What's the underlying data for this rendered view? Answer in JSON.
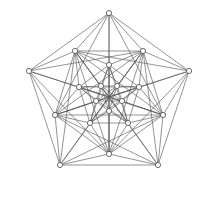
{
  "figure": {
    "width": 216,
    "height": 203,
    "background_color": "#ffffff",
    "edge_color": "#5a5a5a",
    "vertex_stroke_color": "#4a4a4a",
    "vertex_fill_color": "#ffffff",
    "edge_width": 0.65,
    "vertex_radius": 2.6,
    "vertex_count": 20,
    "edge_count": 100,
    "symmetry": "5-fold rotational"
  },
  "chart_data": {
    "type": "scatter",
    "xlabel": "",
    "ylabel": "",
    "xlim": [
      0,
      216
    ],
    "ylim": [
      0,
      203
    ],
    "grid": false,
    "legend": null,
    "rings": [
      {
        "name": "outer-pentagon",
        "radius": 84,
        "rotation_deg": -90
      },
      {
        "name": "second-pentagon",
        "radius": 57,
        "rotation_deg": 90
      },
      {
        "name": "third-pentagon",
        "radius": 32,
        "rotation_deg": -90
      },
      {
        "name": "inner-pentagon",
        "radius": 14,
        "rotation_deg": 90
      }
    ],
    "center": [
      109,
      97
    ],
    "vertices": [
      {
        "id": "A0",
        "ring": "outer-pentagon",
        "x": 109,
        "y": 13
      },
      {
        "id": "A1",
        "ring": "outer-pentagon",
        "x": 189,
        "y": 71
      },
      {
        "id": "A2",
        "ring": "outer-pentagon",
        "x": 158,
        "y": 165
      },
      {
        "id": "A3",
        "ring": "outer-pentagon",
        "x": 60,
        "y": 165
      },
      {
        "id": "A4",
        "ring": "outer-pentagon",
        "x": 29,
        "y": 71
      },
      {
        "id": "B0",
        "ring": "second-pentagon",
        "x": 109,
        "y": 154
      },
      {
        "id": "B1",
        "ring": "second-pentagon",
        "x": 55,
        "y": 115
      },
      {
        "id": "B2",
        "ring": "second-pentagon",
        "x": 75,
        "y": 51
      },
      {
        "id": "B3",
        "ring": "second-pentagon",
        "x": 143,
        "y": 51
      },
      {
        "id": "B4",
        "ring": "second-pentagon",
        "x": 163,
        "y": 115
      },
      {
        "id": "C0",
        "ring": "third-pentagon",
        "x": 109,
        "y": 65
      },
      {
        "id": "C1",
        "ring": "third-pentagon",
        "x": 139,
        "y": 87
      },
      {
        "id": "C2",
        "ring": "third-pentagon",
        "x": 128,
        "y": 123
      },
      {
        "id": "C3",
        "ring": "third-pentagon",
        "x": 90,
        "y": 123
      },
      {
        "id": "C4",
        "ring": "third-pentagon",
        "x": 79,
        "y": 87
      },
      {
        "id": "D0",
        "ring": "inner-pentagon",
        "x": 109,
        "y": 111
      },
      {
        "id": "D1",
        "ring": "inner-pentagon",
        "x": 96,
        "y": 101
      },
      {
        "id": "D2",
        "ring": "inner-pentagon",
        "x": 101,
        "y": 86
      },
      {
        "id": "D3",
        "ring": "inner-pentagon",
        "x": 117,
        "y": 86
      },
      {
        "id": "D4",
        "ring": "inner-pentagon",
        "x": 122,
        "y": 101
      }
    ],
    "edges": [
      [
        "A0",
        "A1"
      ],
      [
        "A1",
        "A2"
      ],
      [
        "A2",
        "A3"
      ],
      [
        "A3",
        "A4"
      ],
      [
        "A4",
        "A0"
      ],
      [
        "A0",
        "B0"
      ],
      [
        "A1",
        "B1"
      ],
      [
        "A2",
        "B2"
      ],
      [
        "A3",
        "B3"
      ],
      [
        "A4",
        "B4"
      ],
      [
        "A0",
        "B1"
      ],
      [
        "A1",
        "B2"
      ],
      [
        "A2",
        "B3"
      ],
      [
        "A3",
        "B4"
      ],
      [
        "A4",
        "B0"
      ],
      [
        "A0",
        "B4"
      ],
      [
        "A1",
        "B0"
      ],
      [
        "A2",
        "B1"
      ],
      [
        "A3",
        "B2"
      ],
      [
        "A4",
        "B3"
      ],
      [
        "A0",
        "B2"
      ],
      [
        "A1",
        "B3"
      ],
      [
        "A2",
        "B4"
      ],
      [
        "A3",
        "B0"
      ],
      [
        "A4",
        "B1"
      ],
      [
        "A0",
        "B3"
      ],
      [
        "A1",
        "B4"
      ],
      [
        "A2",
        "B0"
      ],
      [
        "A3",
        "B1"
      ],
      [
        "A4",
        "B2"
      ],
      [
        "B0",
        "B1"
      ],
      [
        "B1",
        "B2"
      ],
      [
        "B2",
        "B3"
      ],
      [
        "B3",
        "B4"
      ],
      [
        "B4",
        "B0"
      ],
      [
        "B0",
        "B2"
      ],
      [
        "B1",
        "B3"
      ],
      [
        "B2",
        "B4"
      ],
      [
        "B3",
        "B0"
      ],
      [
        "B4",
        "B1"
      ],
      [
        "B0",
        "C0"
      ],
      [
        "B1",
        "C1"
      ],
      [
        "B2",
        "C2"
      ],
      [
        "B3",
        "C3"
      ],
      [
        "B4",
        "C4"
      ],
      [
        "B0",
        "C2"
      ],
      [
        "B1",
        "C3"
      ],
      [
        "B2",
        "C4"
      ],
      [
        "B3",
        "C0"
      ],
      [
        "B4",
        "C1"
      ],
      [
        "B0",
        "C3"
      ],
      [
        "B1",
        "C4"
      ],
      [
        "B2",
        "C0"
      ],
      [
        "B3",
        "C1"
      ],
      [
        "B4",
        "C2"
      ],
      [
        "C0",
        "C1"
      ],
      [
        "C1",
        "C2"
      ],
      [
        "C2",
        "C3"
      ],
      [
        "C3",
        "C4"
      ],
      [
        "C4",
        "C0"
      ],
      [
        "C0",
        "C2"
      ],
      [
        "C1",
        "C3"
      ],
      [
        "C2",
        "C4"
      ],
      [
        "C3",
        "C0"
      ],
      [
        "C4",
        "C1"
      ],
      [
        "C0",
        "D0"
      ],
      [
        "C1",
        "D1"
      ],
      [
        "C2",
        "D2"
      ],
      [
        "C3",
        "D3"
      ],
      [
        "C4",
        "D4"
      ],
      [
        "C0",
        "D2"
      ],
      [
        "C1",
        "D3"
      ],
      [
        "C2",
        "D4"
      ],
      [
        "C3",
        "D0"
      ],
      [
        "C4",
        "D1"
      ],
      [
        "C0",
        "D3"
      ],
      [
        "C1",
        "D4"
      ],
      [
        "C2",
        "D0"
      ],
      [
        "C3",
        "D1"
      ],
      [
        "C4",
        "D2"
      ],
      [
        "D0",
        "D1"
      ],
      [
        "D1",
        "D2"
      ],
      [
        "D2",
        "D3"
      ],
      [
        "D3",
        "D4"
      ],
      [
        "D4",
        "D0"
      ],
      [
        "D0",
        "D2"
      ],
      [
        "D1",
        "D3"
      ],
      [
        "D2",
        "D4"
      ],
      [
        "D3",
        "D0"
      ],
      [
        "D4",
        "D1"
      ],
      [
        "A0",
        "C0"
      ],
      [
        "A1",
        "C1"
      ],
      [
        "A2",
        "C2"
      ],
      [
        "A3",
        "C3"
      ],
      [
        "A4",
        "C4"
      ],
      [
        "B0",
        "D0"
      ],
      [
        "B1",
        "D1"
      ],
      [
        "B2",
        "D2"
      ],
      [
        "B3",
        "D3"
      ],
      [
        "B4",
        "D4"
      ]
    ]
  }
}
